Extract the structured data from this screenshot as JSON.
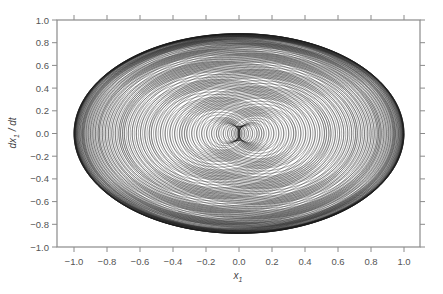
{
  "chart_data": {
    "type": "line",
    "title": "",
    "xlabel": "x₁",
    "ylabel": "dx₁ / dt",
    "xlim": [
      -1.1,
      1.1
    ],
    "ylim": [
      -1.0,
      1.0
    ],
    "x_ticks": [
      -1.0,
      -0.8,
      -0.6,
      -0.4,
      -0.2,
      0.0,
      0.2,
      0.4,
      0.6,
      0.8,
      1.0
    ],
    "x_tick_labels": [
      "−1.0",
      "−0.8",
      "−0.6",
      "−0.4",
      "−0.2",
      "0.0",
      "0.2",
      "0.4",
      "0.6",
      "0.8",
      "1.0"
    ],
    "y_ticks": [
      1.0,
      0.8,
      0.6,
      0.4,
      0.2,
      0.0,
      -0.2,
      -0.4,
      -0.6,
      -0.8,
      -1.0
    ],
    "y_tick_labels": [
      "1.0",
      "0.8",
      "0.6",
      "0.4",
      "0.2",
      "0.0",
      "−0.2",
      "−0.4",
      "−0.6",
      "−0.8",
      "−1.0"
    ],
    "grid": false,
    "legend": null,
    "series": [
      {
        "name": "phase-space trajectory (quasi-periodic)",
        "description": "Dense quasi-periodic orbit filling an oval band; x1 spans about -1.0 to 1.0, dx1/dt spans about -0.89 to 0.88; inner voids centered near x1 = ±0.5, dx1/dt = 0",
        "x_range": [
          -1.0,
          1.0
        ],
        "y_range": [
          -0.89,
          0.88
        ],
        "inner_void_centers": [
          [
            -0.5,
            0.0
          ],
          [
            0.5,
            0.0
          ]
        ],
        "color": "#1a1a1a"
      }
    ]
  },
  "style": {
    "frame_color": "#8a8a8a",
    "label_color": "#555555",
    "curve_color": "#1a1a1a"
  }
}
